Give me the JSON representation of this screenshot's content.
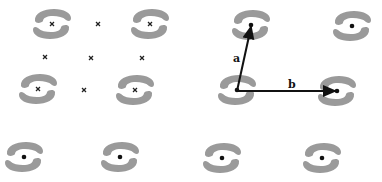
{
  "figure": {
    "colors": {
      "motif": "#9a9a9a",
      "center": "#111111",
      "arrow": "#111111",
      "background": "#ffffff"
    },
    "panel_left": {
      "motifs": [
        {
          "x": 52,
          "y": 24,
          "marker": "x"
        },
        {
          "x": 150,
          "y": 24,
          "marker": "x"
        },
        {
          "x": 38,
          "y": 89,
          "marker": "x"
        },
        {
          "x": 135,
          "y": 90,
          "marker": "x"
        }
      ],
      "symmetry_points": [
        {
          "x": 98,
          "y": 24
        },
        {
          "x": 45,
          "y": 57
        },
        {
          "x": 91,
          "y": 58
        },
        {
          "x": 142,
          "y": 58
        },
        {
          "x": 84,
          "y": 90
        }
      ]
    },
    "panel_right": {
      "motifs": [
        {
          "x": 251,
          "y": 25
        },
        {
          "x": 352,
          "y": 26
        },
        {
          "x": 237,
          "y": 90
        },
        {
          "x": 337,
          "y": 91
        }
      ],
      "vectors": [
        {
          "label": "a",
          "x1": 237,
          "y1": 91,
          "x2": 251,
          "y2": 27,
          "label_x": 233,
          "label_y": 62
        },
        {
          "label": "b",
          "x1": 237,
          "y1": 91,
          "x2": 335,
          "y2": 91,
          "label_x": 288,
          "label_y": 88
        }
      ]
    },
    "bottom_row": {
      "motifs": [
        {
          "x": 24,
          "y": 157
        },
        {
          "x": 120,
          "y": 157
        },
        {
          "x": 222,
          "y": 158
        },
        {
          "x": 322,
          "y": 158
        }
      ]
    }
  }
}
